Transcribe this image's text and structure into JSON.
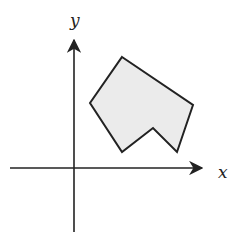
{
  "diagram": {
    "type": "coordinate-plane-polygon",
    "axes": {
      "x_label": "x",
      "y_label": "y"
    },
    "polygon": {
      "fill": "#ebebeb",
      "stroke": "#222222",
      "vertices": [
        [
          122,
          57
        ],
        [
          193,
          105
        ],
        [
          177,
          152
        ],
        [
          153,
          128
        ],
        [
          122,
          152
        ],
        [
          90,
          103
        ]
      ]
    }
  }
}
